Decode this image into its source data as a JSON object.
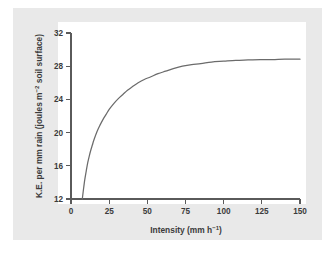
{
  "figure": {
    "background_color": "#e9e9e9",
    "plot_background_color": "#ffffff",
    "axis_color": "#5a5a5a",
    "curve_color": "#6b6b6b"
  },
  "chart_data": {
    "type": "line",
    "title": "",
    "xlabel_main": "Intensity (mm h",
    "xlabel_sup": "−1",
    "xlabel_close": ")",
    "xlabel_full": "Intensity (mm h⁻¹)",
    "ylabel_part1": "K.E. per mm rain (joules m",
    "ylabel_sup": "−2",
    "ylabel_part2": " soil surface)",
    "ylabel_full": "K.E. per mm rain (joules m⁻² soil surface)",
    "xlim": [
      0,
      150
    ],
    "ylim": [
      12,
      32
    ],
    "xticks": [
      0,
      25,
      50,
      75,
      100,
      125,
      150
    ],
    "xtick_labels": [
      "0",
      "25",
      "50",
      "75",
      "100",
      "125",
      "150"
    ],
    "yticks": [
      12,
      16,
      20,
      24,
      28,
      32
    ],
    "ytick_labels": [
      "12",
      "16",
      "20",
      "24",
      "28",
      "32"
    ],
    "grid": false,
    "legend": false,
    "x": [
      7.4,
      8,
      9,
      10,
      11,
      12,
      13,
      14,
      15,
      17,
      19,
      21,
      23,
      25,
      28,
      31,
      34,
      37,
      40,
      44,
      48,
      52,
      57,
      62,
      67,
      73,
      79,
      85,
      92,
      100,
      108,
      116,
      124,
      132,
      140,
      150
    ],
    "y": [
      12.0,
      12.9,
      14.3,
      15.4,
      16.4,
      17.2,
      17.9,
      18.5,
      19.1,
      20.1,
      20.9,
      21.6,
      22.2,
      22.8,
      23.5,
      24.1,
      24.6,
      25.1,
      25.5,
      26.0,
      26.4,
      26.7,
      27.1,
      27.4,
      27.7,
      28.0,
      28.2,
      28.3,
      28.5,
      28.6,
      28.7,
      28.75,
      28.8,
      28.8,
      28.85,
      28.85
    ],
    "series_name": "Kinetic energy vs rainfall intensity",
    "curve_note": "Rises steeply from 12 J at ~7 mm/h, asymptotic plateau near 28.8 J above 120 mm/h"
  }
}
